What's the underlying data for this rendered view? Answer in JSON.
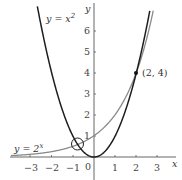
{
  "chart_data": {
    "type": "line",
    "title": "",
    "xlabel": "x",
    "ylabel": "y",
    "xlim": [
      -3.9,
      3.9
    ],
    "ylim": [
      -0.5,
      7
    ],
    "grid": false,
    "x_ticks": [
      -3,
      -2,
      -1,
      1,
      2,
      3
    ],
    "x_tick_labels": [
      "−3",
      "−2",
      "−1",
      "1",
      "2",
      "3"
    ],
    "y_ticks": [
      1,
      2,
      3,
      4,
      5,
      6
    ],
    "y_tick_labels": [
      "1",
      "2",
      "3",
      "4",
      "5",
      "6"
    ],
    "origin_label": "0",
    "series": [
      {
        "name": "y = x²",
        "function": "x^2",
        "color": "#1e1e1e",
        "x": [
          -2.66,
          -2.5,
          -2,
          -1.5,
          -1,
          -0.767,
          -0.5,
          0,
          0.5,
          1,
          1.5,
          2,
          2.5,
          2.6
        ],
        "y": [
          7.08,
          6.25,
          4,
          2.25,
          1,
          0.588,
          0.25,
          0,
          0.25,
          1,
          2.25,
          4,
          6.25,
          6.76
        ]
      },
      {
        "name": "y = 2^x",
        "function": "2^x",
        "color": "#8a8a8a",
        "x": [
          -3.9,
          -3,
          -2,
          -1,
          -0.767,
          0,
          1,
          2,
          2.5,
          2.75
        ],
        "y": [
          0.067,
          0.125,
          0.25,
          0.5,
          0.588,
          1,
          2,
          4,
          5.66,
          6.73
        ]
      }
    ],
    "annotations": [
      {
        "text": "(2, 4)",
        "x": 2,
        "y": 4,
        "type": "point"
      },
      {
        "text": "",
        "x": -0.767,
        "y": 0.588,
        "type": "circle-highlight"
      },
      {
        "text": "y = x",
        "sup": "2",
        "target": "parabola-label"
      },
      {
        "text": "y = 2",
        "sup": "x",
        "target": "exponential-label"
      }
    ]
  },
  "labels": {
    "parabola": {
      "base": "y = x",
      "sup": "2"
    },
    "exponential": {
      "base": "y = 2",
      "sup": "x"
    },
    "point": "(2, 4)",
    "x_axis": "x",
    "y_axis": "y",
    "origin": "0"
  },
  "ticks": {
    "x": [
      "−3",
      "−2",
      "−1",
      "1",
      "2",
      "3"
    ],
    "y": [
      "1",
      "2",
      "3",
      "4",
      "5",
      "6"
    ]
  },
  "colors": {
    "axis": "#555555",
    "parabola": "#1e1e1e",
    "exponential": "#8a8a8a",
    "point": "#111111"
  }
}
